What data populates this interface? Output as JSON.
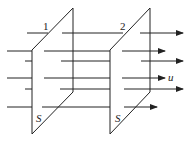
{
  "diagram": {
    "planes": [
      {
        "label": "1",
        "area_label": "S"
      },
      {
        "label": "2",
        "area_label": "S"
      }
    ],
    "velocity_label": "u",
    "colors": {
      "stroke": "#222222",
      "background": "#ffffff"
    }
  }
}
